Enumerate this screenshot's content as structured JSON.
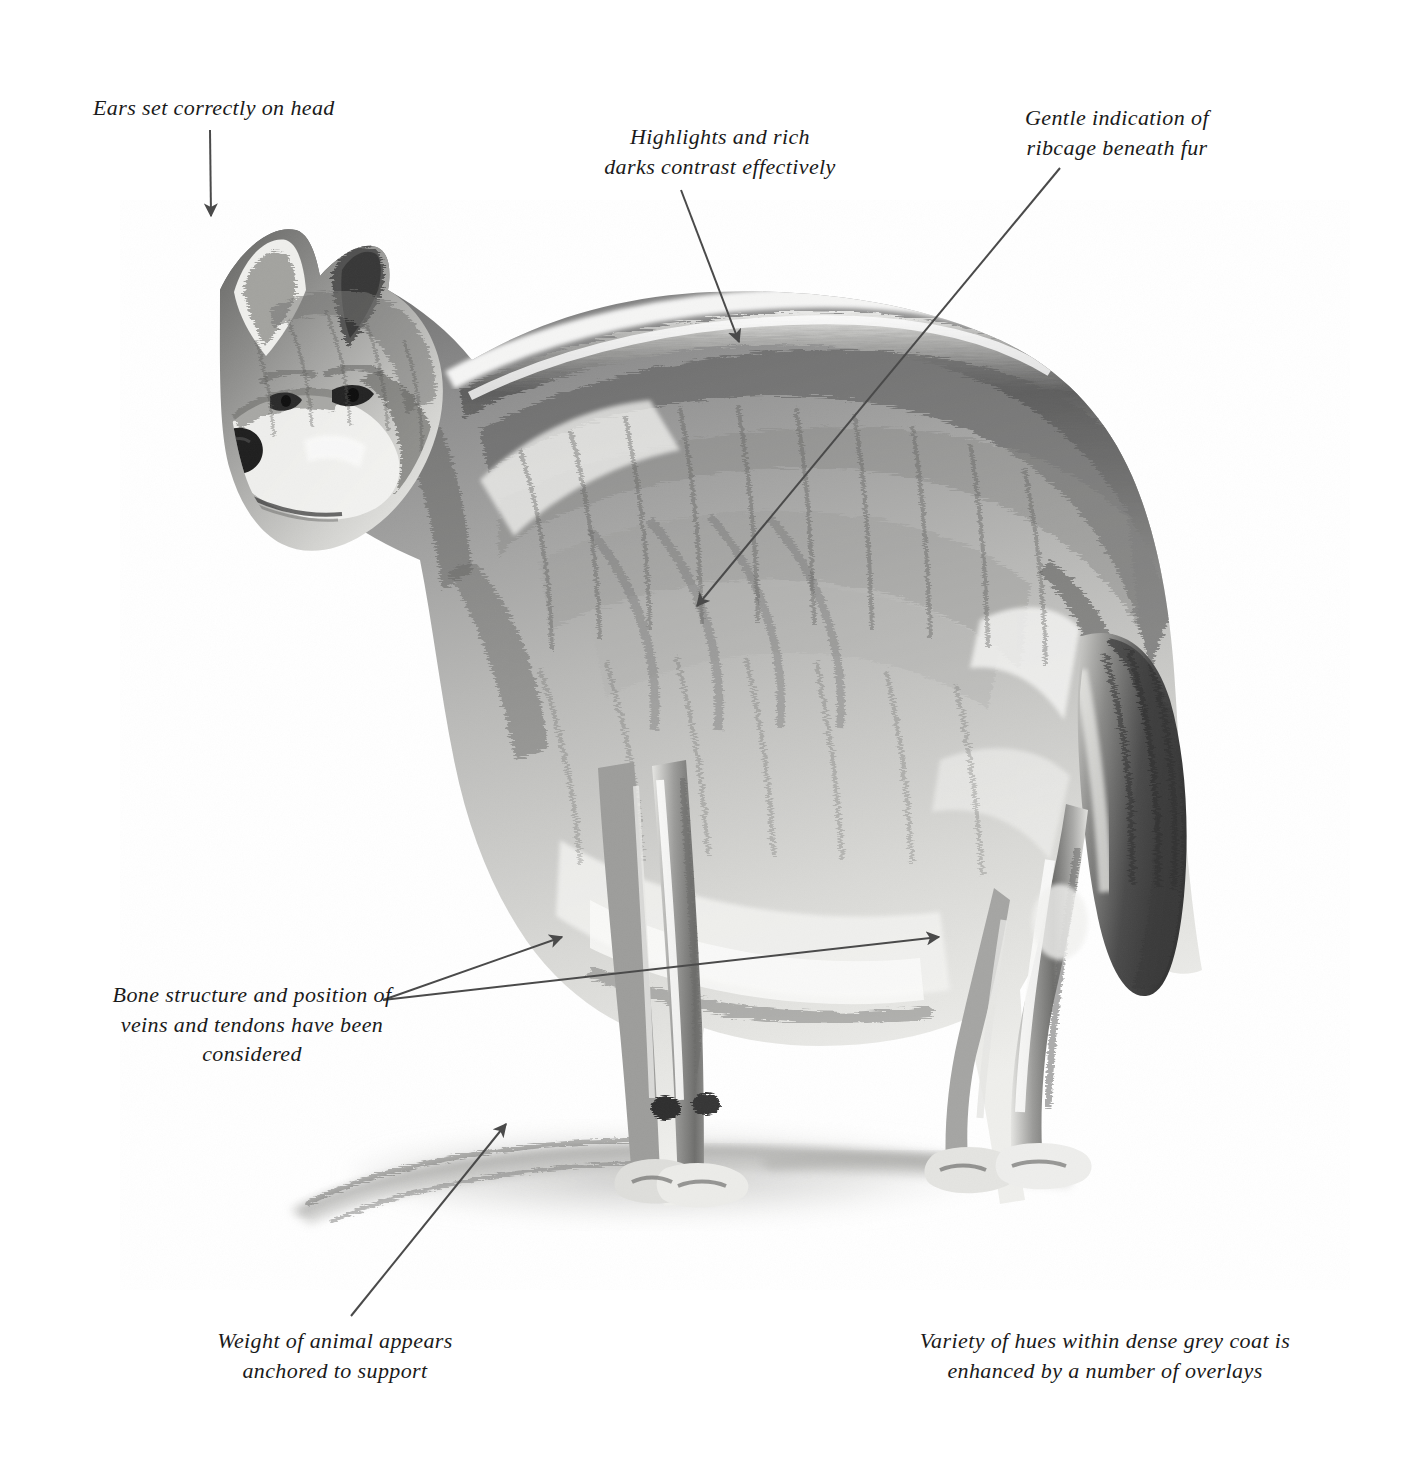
{
  "document": {
    "type": "annotated-pencil-drawing",
    "subject": "grey wolf standing in profile, head turned toward viewer's left",
    "medium": "graphite pencil on textured paper",
    "paper_color": "#f6f6f4",
    "ink_color": "#1a1a1a",
    "arrow_color": "#4a4a4a"
  },
  "annotations": [
    {
      "id": "ears",
      "text": "Ears set correctly on head",
      "align": "left",
      "x": 93,
      "y": 93,
      "width": 320,
      "arrow": {
        "points": [
          [
            210,
            130
          ],
          [
            211,
            216
          ]
        ]
      }
    },
    {
      "id": "highlights",
      "text": "Highlights and rich\ndarks contrast effectively",
      "align": "center",
      "x": 560,
      "y": 122,
      "width": 320,
      "arrow": {
        "points": [
          [
            681,
            190
          ],
          [
            739,
            342
          ]
        ]
      }
    },
    {
      "id": "ribcage",
      "text": "Gentle indication of\nribcage beneath fur",
      "align": "center",
      "x": 972,
      "y": 103,
      "width": 290,
      "arrow": {
        "points": [
          [
            1060,
            168
          ],
          [
            697,
            606
          ]
        ]
      }
    },
    {
      "id": "bone-structure",
      "text": "Bone structure and position of\nveins and tendons have been\nconsidered",
      "align": "center",
      "x": 62,
      "y": 980,
      "width": 380,
      "arrows": [
        {
          "points": [
            [
              383,
              1000
            ],
            [
              562,
              937
            ]
          ]
        },
        {
          "points": [
            [
              383,
              1000
            ],
            [
              939,
              937
            ]
          ]
        }
      ]
    },
    {
      "id": "weight",
      "text": "Weight of animal appears\nanchored to support",
      "align": "center",
      "x": 175,
      "y": 1326,
      "width": 320,
      "arrow": {
        "points": [
          [
            351,
            1316
          ],
          [
            506,
            1124
          ]
        ]
      }
    },
    {
      "id": "hues",
      "text": "Variety of hues within dense grey coat is\nenhanced by a number of overlays",
      "align": "center",
      "x": 890,
      "y": 1326,
      "width": 430,
      "arrow": null
    }
  ],
  "figure": {
    "name": "wolf-drawing",
    "label": "grey wolf pencil study",
    "bounds": {
      "x": 150,
      "y": 215,
      "width": 1160,
      "height": 1060
    }
  }
}
